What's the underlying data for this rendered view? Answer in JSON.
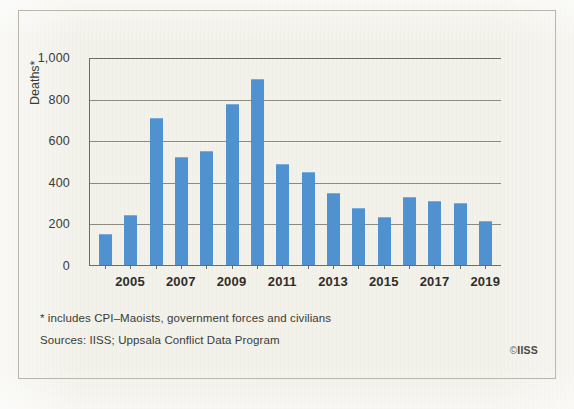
{
  "chart_data": {
    "type": "bar",
    "title": "",
    "xlabel": "",
    "ylabel": "Deaths*",
    "categories": [
      "2004",
      "2005",
      "2006",
      "2007",
      "2008",
      "2009",
      "2010",
      "2011",
      "2012",
      "2013",
      "2014",
      "2015",
      "2016",
      "2017",
      "2018",
      "2019"
    ],
    "values": [
      150,
      242,
      710,
      520,
      550,
      780,
      898,
      490,
      450,
      350,
      275,
      230,
      330,
      310,
      300,
      215
    ],
    "series": [
      {
        "name": "Deaths",
        "values": [
          150,
          242,
          710,
          520,
          550,
          780,
          898,
          490,
          450,
          350,
          275,
          230,
          330,
          310,
          300,
          215
        ]
      }
    ],
    "ylim": [
      0,
      1000
    ],
    "ytick_values": [
      0,
      200,
      400,
      600,
      800,
      1000
    ],
    "ytick_labels": [
      "0",
      "200",
      "400",
      "600",
      "800",
      "1,000"
    ],
    "xtick_labels": [
      "2005",
      "2007",
      "2009",
      "2011",
      "2013",
      "2015",
      "2017",
      "2019"
    ],
    "grid": true,
    "legend": false,
    "legend_position": "none",
    "bar_color": "#5092cf"
  },
  "notes": {
    "footnote": "* includes CPI–Maoists, government forces and civilians",
    "sources": "Sources: IISS; Uppsala Conflict Data Program"
  },
  "credit": {
    "mark": "©",
    "organisation": "IISS"
  },
  "colors": {
    "bar": "#5092cf",
    "background": "#f2f1ea",
    "axis": "#6e6c63",
    "grid": "#8d8b80",
    "text": "#3b3a35"
  }
}
